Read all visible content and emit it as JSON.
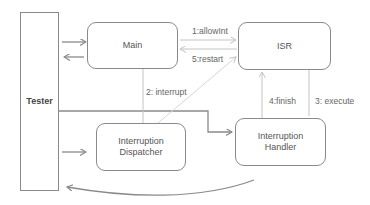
{
  "diagram": {
    "nodes": {
      "tester": "Tester",
      "main": "Main",
      "isr": "ISR",
      "dispatcher": [
        "Interruption",
        "Dispatcher"
      ],
      "handler": [
        "Interruption",
        "Handler"
      ]
    },
    "edges": {
      "allow_int": "1:allowInt",
      "interrupt": "2: interrupt",
      "execute": "3: execute",
      "finish": "4:finish",
      "restart": "5:restart"
    },
    "colors": {
      "border": "#8a8a8a",
      "arrow": "#8a8a8a",
      "dashed": "#c8c8c8",
      "text": "#555555"
    }
  }
}
